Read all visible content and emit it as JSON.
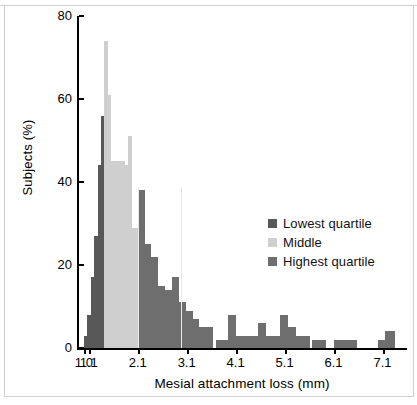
{
  "chart_data": {
    "type": "bar",
    "title": "",
    "subtitle": "",
    "xlabel": "Mesial attachment loss (mm)",
    "ylabel": "Subjects (%)",
    "xlim": [
      0.9,
      7.6
    ],
    "ylim": [
      0,
      80
    ],
    "grid": false,
    "legend_position": "inside-right",
    "y_ticks": [
      0,
      20,
      40,
      60,
      80
    ],
    "y_tick_labels": [
      "0",
      "20",
      "40",
      "60",
      "80"
    ],
    "x_ticks": [
      1.0,
      1.1,
      2.1,
      3.1,
      4.1,
      5.1,
      6.1,
      7.1
    ],
    "x_tick_labels": [
      "1.0",
      "1.1",
      "2.1",
      "3.1",
      "4.1",
      "5.1",
      "6.1",
      "7.1"
    ],
    "legend": [
      {
        "name": "Lowest quartile",
        "color": "#585858"
      },
      {
        "name": "Middle",
        "color": "#cfcfcf"
      },
      {
        "name": "Highest quartile",
        "color": "#6e6e6e"
      }
    ],
    "note": "Histogram of mesial attachment loss; bars are colour-coded by quartile group. Bar values read off the Subjects (%) axis.",
    "bars": [
      {
        "x": 1.0,
        "value": 3,
        "group": "Lowest quartile"
      },
      {
        "x": 1.07,
        "value": 8,
        "group": "Lowest quartile"
      },
      {
        "x": 1.14,
        "value": 17,
        "group": "Lowest quartile"
      },
      {
        "x": 1.21,
        "value": 27,
        "group": "Lowest quartile"
      },
      {
        "x": 1.28,
        "value": 44,
        "group": "Lowest quartile"
      },
      {
        "x": 1.35,
        "value": 56,
        "group": "Lowest quartile"
      },
      {
        "x": 1.42,
        "value": 74,
        "group": "Middle"
      },
      {
        "x": 1.49,
        "value": 61,
        "group": "Middle"
      },
      {
        "x": 1.56,
        "value": 45,
        "group": "Middle"
      },
      {
        "x": 1.63,
        "value": 45,
        "group": "Middle"
      },
      {
        "x": 1.7,
        "value": 45,
        "group": "Middle"
      },
      {
        "x": 1.77,
        "value": 45,
        "group": "Middle"
      },
      {
        "x": 1.84,
        "value": 44,
        "group": "Middle"
      },
      {
        "x": 1.91,
        "value": 51,
        "group": "Middle"
      },
      {
        "x": 1.98,
        "value": 29,
        "group": "Middle"
      },
      {
        "x": 2.1,
        "value": 38,
        "group": "Highest quartile"
      },
      {
        "x": 2.24,
        "value": 25,
        "group": "Highest quartile"
      },
      {
        "x": 2.38,
        "value": 22,
        "group": "Highest quartile"
      },
      {
        "x": 2.52,
        "value": 15,
        "group": "Highest quartile"
      },
      {
        "x": 2.66,
        "value": 14,
        "group": "Highest quartile"
      },
      {
        "x": 2.8,
        "value": 17,
        "group": "Highest quartile"
      },
      {
        "x": 2.94,
        "value": 11,
        "group": "Highest quartile"
      },
      {
        "x": 3.08,
        "value": 9,
        "group": "Highest quartile"
      },
      {
        "x": 3.22,
        "value": 7,
        "group": "Highest quartile"
      },
      {
        "x": 3.36,
        "value": 5,
        "group": "Highest quartile"
      },
      {
        "x": 3.7,
        "value": 2,
        "group": "Highest quartile"
      },
      {
        "x": 3.95,
        "value": 8,
        "group": "Highest quartile"
      },
      {
        "x": 4.1,
        "value": 3,
        "group": "Highest quartile"
      },
      {
        "x": 4.38,
        "value": 3,
        "group": "Highest quartile"
      },
      {
        "x": 4.55,
        "value": 6,
        "group": "Highest quartile"
      },
      {
        "x": 4.72,
        "value": 3,
        "group": "Highest quartile"
      },
      {
        "x": 5.0,
        "value": 8,
        "group": "Highest quartile"
      },
      {
        "x": 5.17,
        "value": 5,
        "group": "Highest quartile"
      },
      {
        "x": 5.34,
        "value": 3,
        "group": "Highest quartile"
      },
      {
        "x": 5.65,
        "value": 2,
        "group": "Highest quartile"
      },
      {
        "x": 6.1,
        "value": 2,
        "group": "Highest quartile"
      },
      {
        "x": 6.3,
        "value": 2,
        "group": "Highest quartile"
      },
      {
        "x": 7.0,
        "value": 2,
        "group": "Highest quartile"
      },
      {
        "x": 7.15,
        "value": 4,
        "group": "Highest quartile"
      }
    ]
  },
  "figure": {
    "background": "#ffffff",
    "axis_color": "#000000"
  }
}
